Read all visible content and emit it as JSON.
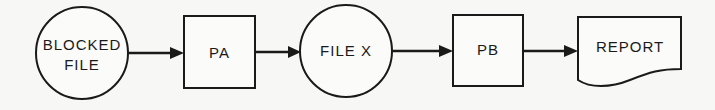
{
  "diagram": {
    "type": "flowchart",
    "direction": "left-to-right",
    "nodes": [
      {
        "id": "blocked_file",
        "shape": "circle",
        "lines": [
          "BLOCKED",
          "FILE"
        ]
      },
      {
        "id": "pa",
        "shape": "process-box",
        "lines": [
          "PA"
        ]
      },
      {
        "id": "file_x",
        "shape": "circle",
        "lines": [
          "FILE X"
        ]
      },
      {
        "id": "pb",
        "shape": "process-box",
        "lines": [
          "PB"
        ]
      },
      {
        "id": "report",
        "shape": "document",
        "lines": [
          "REPORT"
        ]
      }
    ],
    "edges": [
      {
        "from": "blocked_file",
        "to": "pa"
      },
      {
        "from": "pa",
        "to": "file_x"
      },
      {
        "from": "file_x",
        "to": "pb"
      },
      {
        "from": "pb",
        "to": "report"
      }
    ],
    "colors": {
      "stroke": "#1a1a1a",
      "background": "#f7f7f5"
    }
  }
}
